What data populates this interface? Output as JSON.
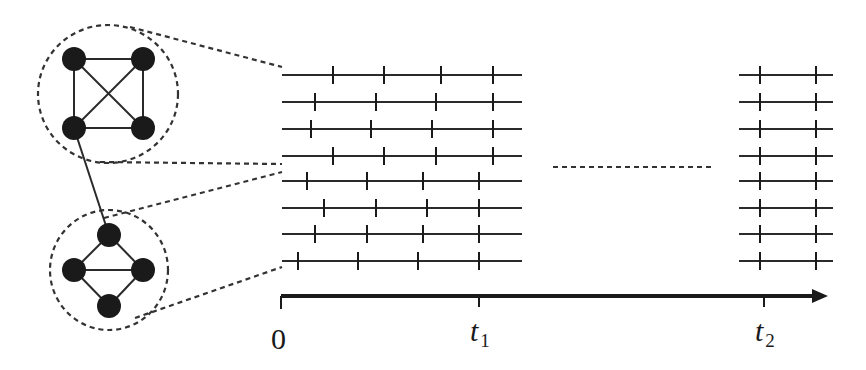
{
  "colors": {
    "ink": "#1a1a1a",
    "line": "#2a2a2a",
    "dash": "#333333",
    "background": "#ffffff"
  },
  "networks": [
    {
      "name": "cluster-complete",
      "circle": {
        "cx": 108,
        "cy": 94,
        "rx": 70,
        "ry": 69
      },
      "nodes": [
        [
          74,
          59
        ],
        [
          143,
          59
        ],
        [
          74,
          128
        ],
        [
          143,
          128
        ]
      ],
      "edges": [
        [
          0,
          1
        ],
        [
          0,
          2
        ],
        [
          1,
          3
        ],
        [
          2,
          3
        ],
        [
          0,
          3
        ],
        [
          1,
          2
        ]
      ]
    },
    {
      "name": "cluster-diamond",
      "circle": {
        "cx": 109,
        "cy": 270,
        "rx": 59,
        "ry": 60
      },
      "nodes": [
        [
          109,
          235
        ],
        [
          74,
          270
        ],
        [
          143,
          270
        ],
        [
          109,
          306
        ]
      ],
      "edges": [
        [
          0,
          1
        ],
        [
          0,
          2
        ],
        [
          1,
          2
        ],
        [
          1,
          3
        ],
        [
          2,
          3
        ]
      ]
    }
  ],
  "node_radius": 12,
  "inter_cluster_edge": [
    [
      74,
      128
    ],
    [
      109,
      235
    ]
  ],
  "zoom_connectors": [
    [
      [
        130,
        27
      ],
      [
        282,
        67
      ]
    ],
    [
      [
        100,
        162
      ],
      [
        282,
        164
      ]
    ],
    [
      [
        104,
        218
      ],
      [
        282,
        172
      ]
    ],
    [
      [
        135,
        318
      ],
      [
        282,
        267
      ]
    ]
  ],
  "spike_trains": {
    "segment1": {
      "x_start": 282,
      "x_end": 522,
      "rows": [
        {
          "y": 75,
          "spikes": [
            333,
            384,
            441,
            493
          ]
        },
        {
          "y": 102,
          "spikes": [
            315,
            376,
            436,
            493
          ]
        },
        {
          "y": 129,
          "spikes": [
            311,
            371,
            432,
            493
          ]
        },
        {
          "y": 156,
          "spikes": [
            333,
            384,
            436,
            493
          ]
        },
        {
          "y": 181,
          "spikes": [
            307,
            367,
            423,
            479
          ]
        },
        {
          "y": 208,
          "spikes": [
            324,
            376,
            427,
            479
          ]
        },
        {
          "y": 234,
          "spikes": [
            315,
            367,
            423,
            479
          ]
        },
        {
          "y": 261,
          "spikes": [
            298,
            358,
            418,
            479
          ]
        }
      ]
    },
    "segment2": {
      "x_start": 739,
      "x_end": 833,
      "rows": [
        {
          "y": 75,
          "spikes": [
            760,
            816
          ]
        },
        {
          "y": 102,
          "spikes": [
            760,
            816
          ]
        },
        {
          "y": 129,
          "spikes": [
            760,
            816
          ]
        },
        {
          "y": 156,
          "spikes": [
            760,
            816
          ]
        },
        {
          "y": 181,
          "spikes": [
            760,
            816
          ]
        },
        {
          "y": 208,
          "spikes": [
            760,
            816
          ]
        },
        {
          "y": 234,
          "spikes": [
            760,
            816
          ]
        },
        {
          "y": 261,
          "spikes": [
            760,
            816
          ]
        }
      ]
    },
    "spike_half_height": 9,
    "ellipsis": {
      "x1": 553,
      "x2": 713,
      "y": 167
    }
  },
  "time_axis": {
    "y": 296,
    "x_start": 281,
    "x_end": 828,
    "ticks": [
      {
        "x": 281,
        "label": "0"
      },
      {
        "x": 479,
        "label": "t",
        "sub": "1"
      },
      {
        "x": 764,
        "label": "t",
        "sub": "2"
      }
    ]
  },
  "labels": {
    "origin": "0",
    "t1_main": "t",
    "t1_sub": "1",
    "t2_main": "t",
    "t2_sub": "2"
  }
}
